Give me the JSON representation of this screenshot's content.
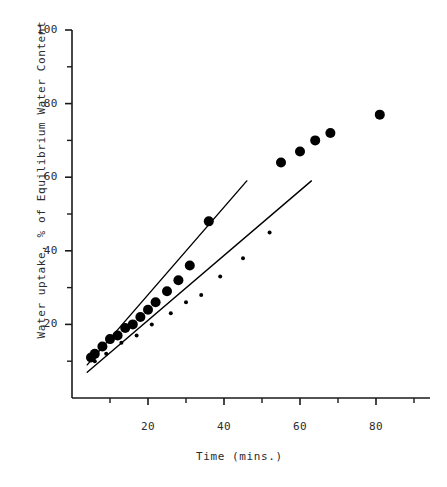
{
  "chart_data": {
    "type": "scatter",
    "title": "",
    "xlabel": "Time (mins.)",
    "ylabel": "Water uptake, % of Equilibrium Water Content",
    "xlim": [
      0,
      90
    ],
    "ylim": [
      0,
      100
    ],
    "xticks_major": [
      20,
      40,
      60,
      80
    ],
    "xticks_minor": [
      10,
      30,
      50,
      70,
      90
    ],
    "yticks_major": [
      20,
      40,
      60,
      80,
      100
    ],
    "yticks_minor": [
      10,
      30,
      50,
      70,
      90
    ],
    "xtick_labels": [
      "20",
      "40",
      "60",
      "80"
    ],
    "ytick_labels": [
      "20",
      "40",
      "60",
      "80",
      "100"
    ],
    "grid": false,
    "legend": "none",
    "series": [
      {
        "name": "large-markers",
        "marker": "filled-circle-large",
        "marker_size": 5,
        "color": "#000000",
        "x": [
          5,
          6,
          8,
          10,
          12,
          14,
          16,
          18,
          20,
          22,
          25,
          28,
          31,
          36,
          55,
          60,
          64,
          68,
          81
        ],
        "y": [
          11,
          12,
          14,
          16,
          17,
          19,
          20,
          22,
          24,
          26,
          29,
          32,
          36,
          48,
          64,
          67,
          70,
          72,
          77
        ]
      },
      {
        "name": "small-markers",
        "marker": "filled-circle-small",
        "marker_size": 2,
        "color": "#000000",
        "x": [
          6,
          9,
          13,
          17,
          21,
          26,
          30,
          34,
          39,
          45,
          52
        ],
        "y": [
          10,
          12,
          15,
          17,
          20,
          23,
          26,
          28,
          33,
          38,
          45
        ]
      }
    ],
    "fit_lines": [
      {
        "name": "upper-fit-line",
        "x1": 4,
        "y1": 9,
        "x2": 46,
        "y2": 59,
        "color": "#000000",
        "width": 1.4
      },
      {
        "name": "lower-fit-line",
        "x1": 4,
        "y1": 7,
        "x2": 63,
        "y2": 59,
        "color": "#000000",
        "width": 1.4
      }
    ],
    "axis_color": "#1a1a1a"
  },
  "axes": {
    "x_title": "Time (mins.)",
    "y_title": "Water uptake, % of Equilibrium Water Content",
    "y_labels": [
      {
        "text": "100",
        "value": 100
      },
      {
        "text": "80",
        "value": 80
      },
      {
        "text": "60",
        "value": 60
      },
      {
        "text": "40",
        "value": 40
      },
      {
        "text": "20",
        "value": 20
      }
    ],
    "x_labels": [
      {
        "text": "20",
        "value": 20
      },
      {
        "text": "40",
        "value": 40
      },
      {
        "text": "60",
        "value": 60
      },
      {
        "text": "80",
        "value": 80
      }
    ]
  }
}
